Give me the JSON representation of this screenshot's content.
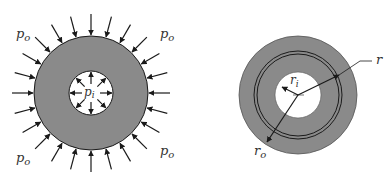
{
  "left_figure": {
    "title": "Thick-walled cylinder under pressure",
    "labels": {
      "po_top_left": "p",
      "po_top_left_sub": "o",
      "po_top_right": "p",
      "po_top_right_sub": "o",
      "po_bottom_left": "p",
      "po_bottom_left_sub": "o",
      "po_bottom_right": "p",
      "po_bottom_right_sub": "o",
      "pi": "p",
      "pi_sub": "i"
    },
    "outer_arrow_count": 24,
    "inner_arrow_count": 8
  },
  "right_figure": {
    "title": "Cylinder radii",
    "labels": {
      "r": "r",
      "ri": "r",
      "ri_sub": "i",
      "ro": "r",
      "ro_sub": "o"
    }
  },
  "colors": {
    "fill": "#8a8a8a",
    "stroke": "#1a1a1a",
    "background": "#ffffff",
    "text": "#333333"
  }
}
